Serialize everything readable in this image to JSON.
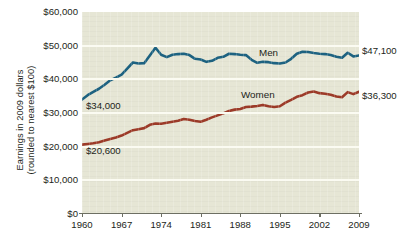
{
  "chart_data": {
    "type": "line",
    "title": "",
    "xlabel": "",
    "ylabel": "Earnings in 2009 dollars (rounded to nearest $100)",
    "ylabel_line1": "Earnings in 2009 dollars",
    "ylabel_line2": "(rounded to nearest $100)",
    "xlim": [
      1960,
      2009
    ],
    "ylim": [
      0,
      60000
    ],
    "grid": true,
    "legend_position": "inline-labels",
    "y_ticks": [
      0,
      10000,
      20000,
      30000,
      40000,
      50000,
      60000
    ],
    "y_tick_labels": [
      "$0",
      "$10,000",
      "$20,000",
      "$30,000",
      "$40,000",
      "$50,000",
      "$60,000"
    ],
    "x_ticks": [
      1960,
      1967,
      1974,
      1981,
      1988,
      1995,
      2002,
      2009
    ],
    "x_tick_labels": [
      "1960",
      "1967",
      "1974",
      "1981",
      "1988",
      "1995",
      "2002",
      "2009"
    ],
    "x": [
      1960,
      1961,
      1962,
      1963,
      1964,
      1965,
      1966,
      1967,
      1968,
      1969,
      1970,
      1971,
      1972,
      1973,
      1974,
      1975,
      1976,
      1977,
      1978,
      1979,
      1980,
      1981,
      1982,
      1983,
      1984,
      1985,
      1986,
      1987,
      1988,
      1989,
      1990,
      1991,
      1992,
      1993,
      1994,
      1995,
      1996,
      1997,
      1998,
      1999,
      2000,
      2001,
      2002,
      2003,
      2004,
      2005,
      2006,
      2007,
      2008,
      2009
    ],
    "series": [
      {
        "name": "Men",
        "color": "#1d6281",
        "label": "Men",
        "start_label": "$34,000",
        "end_label": "$47,100",
        "start_value": 34000,
        "end_value": 47100,
        "values": [
          34000,
          35300,
          36300,
          37200,
          38400,
          39700,
          40500,
          41400,
          43200,
          45000,
          44700,
          44800,
          47100,
          49400,
          47300,
          46600,
          47300,
          47500,
          47600,
          47200,
          46100,
          45900,
          45200,
          45500,
          46400,
          46700,
          47600,
          47500,
          47300,
          47200,
          45800,
          44900,
          45200,
          45100,
          44800,
          44700,
          45000,
          46100,
          47600,
          48200,
          48100,
          47800,
          47600,
          47500,
          47200,
          46700,
          46400,
          47900,
          46800,
          47100
        ]
      },
      {
        "name": "Women",
        "color": "#9c3a28",
        "label": "Women",
        "start_label": "$20,600",
        "end_label": "$36,300",
        "start_value": 20600,
        "end_value": 36300,
        "values": [
          20600,
          20800,
          21000,
          21300,
          21800,
          22300,
          22700,
          23300,
          24100,
          24900,
          25200,
          25500,
          26500,
          26900,
          26800,
          27100,
          27400,
          27700,
          28200,
          28000,
          27600,
          27400,
          28000,
          28700,
          29300,
          29900,
          30600,
          31000,
          31200,
          31800,
          31900,
          32100,
          32400,
          32000,
          31800,
          32000,
          33100,
          33900,
          34800,
          35300,
          36100,
          36400,
          35900,
          35700,
          35400,
          34900,
          34700,
          36200,
          35600,
          36300
        ]
      }
    ]
  },
  "annotations": {
    "men_series_label": "Men",
    "women_series_label": "Women",
    "men_start": "$34,000",
    "men_end": "$47,100",
    "women_start": "$20,600",
    "women_end": "$36,300"
  },
  "colors": {
    "men_line": "#1d6281",
    "women_line": "#9c3a28",
    "plot_background": "#e6e6d5",
    "gridline": "#fbfbf2",
    "axis": "#6d6f63",
    "text": "#231f20"
  }
}
